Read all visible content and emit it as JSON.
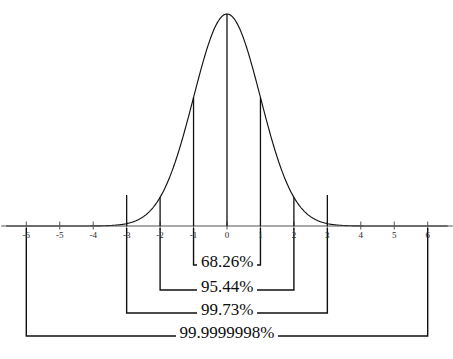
{
  "figure": {
    "kind": "normal-distribution-sigma-diagram",
    "background_color": "#ffffff",
    "line_color": "#111111",
    "axis_color": "#555555"
  },
  "axis": {
    "label": "",
    "tick_labels": [
      "-6",
      "-5",
      "-4",
      "-3",
      "-2",
      "-1",
      "0",
      "1",
      "2",
      "3",
      "4",
      "5",
      "6"
    ],
    "tick_values": [
      -6,
      -5,
      -4,
      -3,
      -2,
      -1,
      0,
      1,
      2,
      3,
      4,
      5,
      6
    ]
  },
  "brackets": [
    {
      "name": "one-sigma",
      "label": "68.26%",
      "from": -1,
      "to": 1
    },
    {
      "name": "two-sigma",
      "label": "95.44%",
      "from": -2,
      "to": 2
    },
    {
      "name": "three-sigma",
      "label": "99.73%",
      "from": -3,
      "to": 3
    },
    {
      "name": "six-sigma",
      "label": "99.9999998%",
      "from": -6,
      "to": 6
    }
  ],
  "chart_data": {
    "type": "line",
    "title": "",
    "subtitle": "",
    "xlabel": "",
    "ylabel": "",
    "xlim": [
      -6.6,
      6.6
    ],
    "ylim": [
      0,
      0.4
    ],
    "grid": false,
    "legend": null,
    "distribution": {
      "name": "standard normal",
      "mean": 0,
      "sd": 1,
      "pdf": "(1/sqrt(2*pi))*exp(-x^2/2)"
    },
    "x": [
      -6,
      -5.5,
      -5,
      -4.5,
      -4,
      -3.5,
      -3,
      -2.5,
      -2,
      -1.5,
      -1,
      -0.5,
      0,
      0.5,
      1,
      1.5,
      2,
      2.5,
      3,
      3.5,
      4,
      4.5,
      5,
      5.5,
      6
    ],
    "y": [
      6e-09,
      1.1e-07,
      1.5e-06,
      1.6e-05,
      0.000134,
      0.000873,
      0.004432,
      0.017528,
      0.053991,
      0.129518,
      0.241971,
      0.352065,
      0.398942,
      0.352065,
      0.241971,
      0.129518,
      0.053991,
      0.017528,
      0.004432,
      0.000873,
      0.000134,
      1.6e-05,
      1.5e-06,
      1.1e-07,
      6e-09
    ],
    "annotations": [
      {
        "text": "68.26%",
        "interval": [
          -1,
          1
        ],
        "meaning": "area within 1 standard deviation"
      },
      {
        "text": "95.44%",
        "interval": [
          -2,
          2
        ],
        "meaning": "area within 2 standard deviations"
      },
      {
        "text": "99.73%",
        "interval": [
          -3,
          3
        ],
        "meaning": "area within 3 standard deviations"
      },
      {
        "text": "99.9999998%",
        "interval": [
          -6,
          6
        ],
        "meaning": "area within 6 standard deviations"
      }
    ],
    "vertical_markers": [
      -2,
      -1,
      0,
      1,
      2
    ],
    "tick_markers": [
      -3,
      3
    ]
  }
}
